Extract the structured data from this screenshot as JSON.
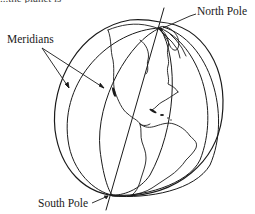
{
  "figure": {
    "type": "globe-meridians-diagram",
    "top_cutoff_text": "...the planet is subdivided...",
    "labels": {
      "meridians": "Meridians",
      "north_pole": "North Pole",
      "south_pole": "South Pole"
    },
    "colors": {
      "ink": "#1a1a1a",
      "background": "#ffffff"
    },
    "elements": [
      {
        "name": "globe-outline",
        "description": "outer circle of the Earth"
      },
      {
        "name": "meridian-lines",
        "count": 4,
        "description": "great-circle ellipses passing through both poles"
      },
      {
        "name": "polar-axis",
        "description": "straight line through North and South Pole"
      },
      {
        "name": "continents",
        "items": [
          "North America",
          "Central America",
          "South America",
          "Greenland"
        ]
      }
    ]
  }
}
